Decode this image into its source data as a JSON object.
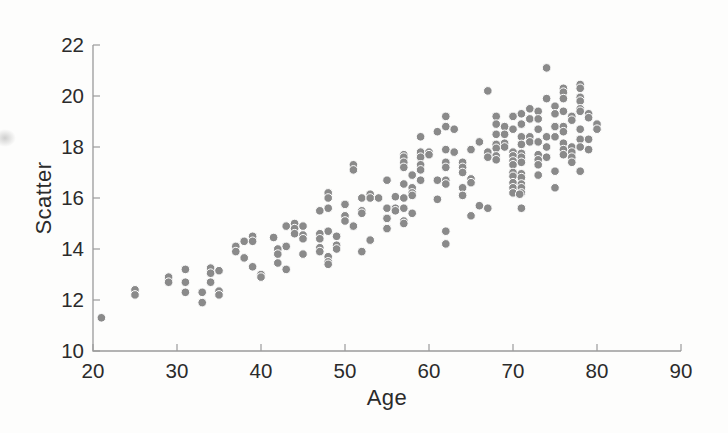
{
  "figure": {
    "background": "#fdfdfc",
    "axis_color": "#9b9b9b",
    "text_color": "#2b2b2b"
  },
  "chart_data": {
    "type": "scatter",
    "title": "",
    "xlabel": "Age",
    "ylabel": "Scatter",
    "xlim": [
      20,
      90
    ],
    "ylim": [
      10,
      22
    ],
    "xticks": [
      20,
      30,
      40,
      50,
      60,
      70,
      80,
      90
    ],
    "yticks": [
      10,
      12,
      14,
      16,
      18,
      20,
      22
    ],
    "grid": false,
    "legend": null,
    "marker": {
      "shape": "circle",
      "color": "#8a8a8a",
      "edge_color": "#ffffff",
      "radius": 4.3
    },
    "points": [
      [
        21,
        11.3
      ],
      [
        25,
        12.4
      ],
      [
        25,
        12.2
      ],
      [
        29,
        12.9
      ],
      [
        29,
        12.7
      ],
      [
        31,
        13.2
      ],
      [
        31,
        12.7
      ],
      [
        31,
        12.3
      ],
      [
        33,
        12.3
      ],
      [
        33,
        11.9
      ],
      [
        34,
        13.25
      ],
      [
        34,
        13.05
      ],
      [
        34,
        12.7
      ],
      [
        35,
        13.15
      ],
      [
        35,
        12.35
      ],
      [
        35,
        12.2
      ],
      [
        37,
        14.1
      ],
      [
        37,
        13.9
      ],
      [
        38,
        14.3
      ],
      [
        38,
        13.65
      ],
      [
        39,
        14.5
      ],
      [
        39,
        14.3
      ],
      [
        39,
        13.3
      ],
      [
        40,
        13.0
      ],
      [
        40,
        12.9
      ],
      [
        41.5,
        14.45
      ],
      [
        42,
        14.0
      ],
      [
        42,
        13.8
      ],
      [
        42,
        13.45
      ],
      [
        43,
        14.9
      ],
      [
        43,
        14.1
      ],
      [
        43,
        13.2
      ],
      [
        44,
        15.0
      ],
      [
        44,
        14.8
      ],
      [
        44,
        14.6
      ],
      [
        45,
        14.9
      ],
      [
        45,
        14.55
      ],
      [
        45,
        14.4
      ],
      [
        45,
        13.8
      ],
      [
        47,
        15.5
      ],
      [
        47,
        14.6
      ],
      [
        47,
        14.4
      ],
      [
        47,
        14.05
      ],
      [
        47,
        13.9
      ],
      [
        48,
        16.2
      ],
      [
        48,
        16.0
      ],
      [
        48,
        15.6
      ],
      [
        48,
        14.7
      ],
      [
        48,
        13.7
      ],
      [
        48,
        13.5
      ],
      [
        48,
        13.4
      ],
      [
        49,
        14.5
      ],
      [
        49,
        14.15
      ],
      [
        49,
        14.0
      ],
      [
        50,
        15.75
      ],
      [
        50,
        15.3
      ],
      [
        50,
        15.1
      ],
      [
        51,
        17.3
      ],
      [
        51,
        17.1
      ],
      [
        51,
        14.9
      ],
      [
        52,
        16.0
      ],
      [
        52,
        15.5
      ],
      [
        52,
        15.4
      ],
      [
        52,
        13.9
      ],
      [
        53,
        16.15
      ],
      [
        53,
        16.0
      ],
      [
        53,
        14.35
      ],
      [
        54,
        16.0
      ],
      [
        55,
        16.7
      ],
      [
        55,
        15.6
      ],
      [
        55,
        15.2
      ],
      [
        55,
        14.8
      ],
      [
        56,
        16.05
      ],
      [
        56,
        15.6
      ],
      [
        56,
        15.5
      ],
      [
        57,
        17.7
      ],
      [
        57,
        17.6
      ],
      [
        57,
        17.4
      ],
      [
        57,
        17.2
      ],
      [
        57,
        16.55
      ],
      [
        57,
        16.0
      ],
      [
        57,
        15.6
      ],
      [
        57,
        15.1
      ],
      [
        57,
        15.0
      ],
      [
        58,
        16.9
      ],
      [
        58,
        16.4
      ],
      [
        58,
        16.2
      ],
      [
        58,
        16.1
      ],
      [
        58,
        15.4
      ],
      [
        59,
        18.4
      ],
      [
        59,
        17.8
      ],
      [
        59,
        17.6
      ],
      [
        59,
        17.3
      ],
      [
        59,
        17.1
      ],
      [
        59,
        16.7
      ],
      [
        60,
        17.8
      ],
      [
        60,
        17.7
      ],
      [
        61,
        18.6
      ],
      [
        61,
        16.7
      ],
      [
        61,
        15.95
      ],
      [
        62,
        19.2
      ],
      [
        62,
        18.8
      ],
      [
        62,
        17.9
      ],
      [
        62,
        17.4
      ],
      [
        62,
        17.2
      ],
      [
        62,
        16.7
      ],
      [
        62,
        16.55
      ],
      [
        62,
        14.7
      ],
      [
        62,
        14.2
      ],
      [
        63,
        18.7
      ],
      [
        63,
        17.8
      ],
      [
        64,
        17.4
      ],
      [
        64,
        17.2
      ],
      [
        64,
        17.0
      ],
      [
        64,
        16.4
      ],
      [
        64,
        16.1
      ],
      [
        65,
        17.9
      ],
      [
        65,
        16.75
      ],
      [
        65,
        16.6
      ],
      [
        65,
        15.3
      ],
      [
        66,
        18.2
      ],
      [
        66,
        15.7
      ],
      [
        67,
        20.2
      ],
      [
        67,
        17.8
      ],
      [
        67,
        17.6
      ],
      [
        67,
        15.6
      ],
      [
        68,
        19.2
      ],
      [
        68,
        18.9
      ],
      [
        68,
        18.5
      ],
      [
        68,
        18.1
      ],
      [
        68,
        17.95
      ],
      [
        68,
        17.65
      ],
      [
        68,
        17.5
      ],
      [
        69,
        18.8
      ],
      [
        69,
        18.5
      ],
      [
        69,
        18.15
      ],
      [
        69,
        18.0
      ],
      [
        70,
        19.2
      ],
      [
        70,
        18.7
      ],
      [
        70,
        17.8
      ],
      [
        70,
        17.65
      ],
      [
        70,
        17.45
      ],
      [
        70,
        17.3
      ],
      [
        70,
        17.0
      ],
      [
        70,
        16.85
      ],
      [
        70,
        16.6
      ],
      [
        70,
        16.4
      ],
      [
        70,
        16.2
      ],
      [
        70.8,
        16.15
      ],
      [
        71,
        19.3
      ],
      [
        71,
        18.9
      ],
      [
        71,
        18.4
      ],
      [
        71,
        18.1
      ],
      [
        71,
        17.75
      ],
      [
        71,
        17.6
      ],
      [
        71,
        17.4
      ],
      [
        71,
        16.95
      ],
      [
        71,
        16.8
      ],
      [
        71,
        16.55
      ],
      [
        71,
        16.4
      ],
      [
        71,
        16.2
      ],
      [
        71,
        15.6
      ],
      [
        72,
        19.5
      ],
      [
        72,
        19.1
      ],
      [
        72,
        18.4
      ],
      [
        72,
        18.2
      ],
      [
        73,
        19.4
      ],
      [
        73,
        19.1
      ],
      [
        73,
        18.7
      ],
      [
        73,
        18.2
      ],
      [
        73,
        17.7
      ],
      [
        73,
        17.5
      ],
      [
        73,
        17.3
      ],
      [
        73,
        16.9
      ],
      [
        74,
        21.1
      ],
      [
        74,
        19.9
      ],
      [
        74,
        18.4
      ],
      [
        74,
        18.0
      ],
      [
        74,
        17.6
      ],
      [
        75,
        19.6
      ],
      [
        75,
        19.3
      ],
      [
        75,
        18.8
      ],
      [
        75,
        18.4
      ],
      [
        75,
        17.05
      ],
      [
        75,
        16.4
      ],
      [
        76,
        20.3
      ],
      [
        76,
        20.15
      ],
      [
        76,
        19.9
      ],
      [
        76,
        19.4
      ],
      [
        76,
        18.8
      ],
      [
        76,
        18.6
      ],
      [
        76,
        18.15
      ],
      [
        76,
        17.9
      ],
      [
        76,
        17.7
      ],
      [
        77,
        19.2
      ],
      [
        77,
        19.05
      ],
      [
        77,
        18.0
      ],
      [
        77,
        17.8
      ],
      [
        77,
        17.6
      ],
      [
        77,
        17.4
      ],
      [
        78,
        20.45
      ],
      [
        78,
        20.3
      ],
      [
        78,
        19.95
      ],
      [
        78,
        19.8
      ],
      [
        78,
        19.5
      ],
      [
        78,
        19.4
      ],
      [
        78,
        18.7
      ],
      [
        78,
        18.3
      ],
      [
        78,
        18.0
      ],
      [
        78,
        17.05
      ],
      [
        79,
        19.3
      ],
      [
        79,
        19.15
      ],
      [
        79,
        18.3
      ],
      [
        79,
        17.9
      ],
      [
        80,
        18.9
      ],
      [
        80,
        18.7
      ]
    ]
  }
}
